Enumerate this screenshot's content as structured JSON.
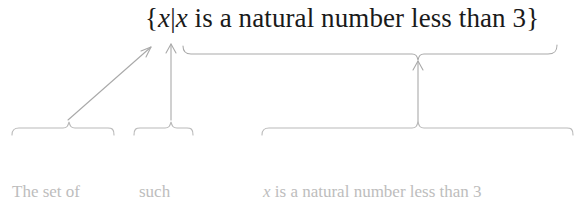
{
  "figure": {
    "kind": "set-builder-notation-annotated-diagram",
    "background_color": "#ffffff",
    "formula_color": "#1a1a1a",
    "annotation_color": "#bdbdbd",
    "rule_color": "#a8a8a8"
  },
  "formula": {
    "full_text": "{x|x is a natural number less than 3}",
    "open_brace": "{",
    "variable": "x",
    "bar": "|",
    "condition": "x is a natural number less than 3",
    "condition_prefix": " is a natural number less than 3",
    "close_brace": "}"
  },
  "annotations": [
    {
      "id": "set-of-all-x",
      "line_1": "The set of",
      "line_2_prefix": "all ",
      "line_2_var": "x",
      "points_to": "open-brace-and-variable",
      "connector": "diagonal-arrow"
    },
    {
      "id": "such-that",
      "line_1": "such",
      "line_2_prefix": "that",
      "line_2_var": "",
      "points_to": "vertical-bar",
      "connector": "vertical-arrow"
    },
    {
      "id": "condition",
      "line_1_var": "x",
      "line_1_rest": " is a natural number less than 3",
      "points_to": "condition-expression",
      "connector": "vertical-arrow"
    }
  ]
}
